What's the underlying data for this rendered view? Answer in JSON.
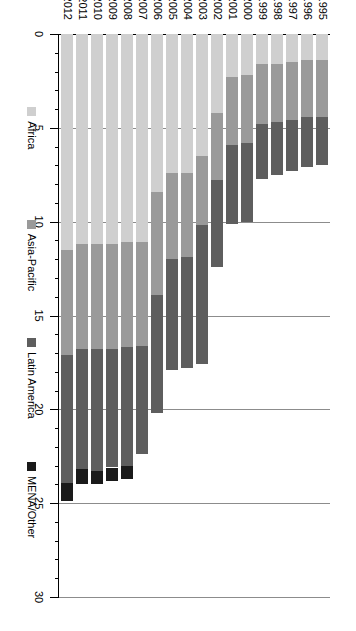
{
  "chart_data": {
    "type": "bar",
    "orientation": "horizontal-stacked",
    "title": "",
    "subtitle": "",
    "xlabel": "",
    "ylabel": "",
    "stacked": true,
    "grid": true,
    "legend_position": "bottom",
    "value_axis": {
      "min": 0,
      "max": 30,
      "ticks": [
        0,
        5,
        10,
        15,
        20,
        25,
        30
      ],
      "tick_labels": [
        "0",
        "5",
        "10",
        "15",
        "20",
        "25",
        "30"
      ],
      "minor_tick_step": 1,
      "direction": "right-to-left"
    },
    "categories": [
      "1995",
      "1996",
      "1997",
      "1998",
      "1999",
      "2000",
      "2001",
      "2002",
      "2003",
      "2004",
      "2005",
      "2006",
      "2007",
      "2008",
      "2009",
      "2010",
      "2011",
      "2012"
    ],
    "series": [
      {
        "name": "Africa",
        "color": "#cfcfcf",
        "values": [
          1.4,
          1.4,
          1.5,
          1.6,
          1.6,
          2.2,
          2.3,
          4.2,
          6.5,
          7.4,
          7.4,
          8.4,
          11.1,
          11.1,
          11.2,
          11.2,
          11.2,
          11.5
        ]
      },
      {
        "name": "Asia-Pacific",
        "color": "#9a9a9a",
        "values": [
          3.0,
          3.0,
          3.1,
          3.1,
          3.2,
          3.6,
          3.6,
          3.6,
          3.7,
          4.5,
          4.6,
          5.5,
          5.5,
          5.6,
          5.6,
          5.6,
          5.6,
          5.6
        ]
      },
      {
        "name": "Latin America",
        "color": "#5e5e5e",
        "values": [
          2.6,
          2.7,
          2.7,
          2.8,
          2.9,
          4.2,
          4.2,
          4.6,
          7.4,
          5.9,
          5.9,
          6.3,
          5.8,
          6.3,
          6.3,
          6.5,
          6.4,
          6.8
        ]
      },
      {
        "name": "MENA/Other",
        "color": "#1a1a1a",
        "values": [
          0.0,
          0.0,
          0.0,
          0.0,
          0.0,
          0.0,
          0.0,
          0.0,
          0.0,
          0.0,
          0.0,
          0.0,
          0.0,
          0.7,
          0.7,
          0.7,
          0.8,
          1.0
        ]
      }
    ],
    "totals": [
      7.0,
      7.1,
      7.3,
      7.5,
      7.7,
      10.0,
      10.1,
      12.4,
      17.6,
      17.8,
      17.9,
      20.2,
      22.4,
      23.7,
      23.8,
      24.0,
      24.0,
      24.9
    ]
  },
  "legend": {
    "items": [
      {
        "label": "Africa",
        "color": "#cfcfcf",
        "swatch_name": "legend-swatch-africa"
      },
      {
        "label": "Asia-Pacific",
        "color": "#9a9a9a",
        "swatch_name": "legend-swatch-asia-pacific"
      },
      {
        "label": "Latin America",
        "color": "#5e5e5e",
        "swatch_name": "legend-swatch-latin-america"
      },
      {
        "label": "MENA/Other",
        "color": "#1a1a1a",
        "swatch_name": "legend-swatch-mena-other"
      }
    ]
  },
  "colors": {
    "background": "#ffffff",
    "axis": "#000000",
    "gridline": "#8c8c8c",
    "text": "#000000"
  }
}
